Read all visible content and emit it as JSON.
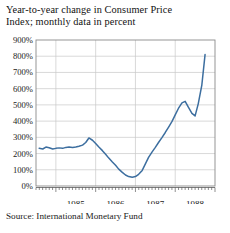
{
  "title": {
    "line1": "Year-to-year change in Consumer Price",
    "line2": "Index; monthly data in percent"
  },
  "source": "Source: International Monetary Fund",
  "colors": {
    "line": "#3c6e9f",
    "grid": "#c9c9c9",
    "frame": "#8a8a8a",
    "text": "#1a1a1a",
    "background": "#ffffff"
  },
  "chart_data": {
    "type": "line",
    "title": "Year-to-year change in Consumer Price Index; monthly data in percent",
    "xlabel": "",
    "ylabel": "",
    "ylim": [
      0,
      900
    ],
    "yticks": [
      0,
      100,
      200,
      300,
      400,
      500,
      600,
      700,
      800,
      900
    ],
    "ytick_labels": [
      "0%",
      "100%",
      "200%",
      "300%",
      "400%",
      "500%",
      "600%",
      "700%",
      "800%",
      "900%"
    ],
    "xlim": [
      1984.5,
      1989.0
    ],
    "xticks": [
      1985,
      1986,
      1987,
      1988
    ],
    "xtick_labels": [
      "1985",
      "1986",
      "1987",
      "1988"
    ],
    "minor_xticks_per_year": 12,
    "grid": true,
    "legend": null,
    "series": [
      {
        "name": "CPI year-to-year change",
        "color": "#3c6e9f",
        "x": [
          1984.58,
          1984.67,
          1984.75,
          1984.83,
          1984.92,
          1985.0,
          1985.08,
          1985.17,
          1985.25,
          1985.33,
          1985.42,
          1985.5,
          1985.58,
          1985.67,
          1985.75,
          1985.83,
          1985.92,
          1986.0,
          1986.08,
          1986.17,
          1986.25,
          1986.33,
          1986.42,
          1986.5,
          1986.58,
          1986.67,
          1986.75,
          1986.83,
          1986.92,
          1987.0,
          1987.08,
          1987.17,
          1987.25,
          1987.33,
          1987.42,
          1987.5,
          1987.58,
          1987.67,
          1987.75,
          1987.83,
          1987.92,
          1988.0,
          1988.08,
          1988.17,
          1988.25,
          1988.33,
          1988.42,
          1988.5,
          1988.58,
          1988.67,
          1988.75
        ],
        "y": [
          232,
          228,
          240,
          236,
          228,
          232,
          235,
          232,
          238,
          240,
          238,
          240,
          245,
          252,
          268,
          296,
          282,
          262,
          240,
          218,
          196,
          172,
          148,
          128,
          104,
          84,
          68,
          58,
          54,
          58,
          72,
          96,
          136,
          176,
          210,
          238,
          268,
          300,
          330,
          362,
          398,
          438,
          478,
          512,
          522,
          486,
          448,
          432,
          508,
          624,
          810
        ]
      }
    ]
  }
}
